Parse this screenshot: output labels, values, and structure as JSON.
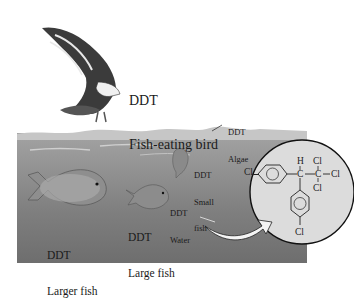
{
  "labels": {
    "bird": {
      "line1": "DDT",
      "line2": "Fish-eating bird"
    },
    "algae": {
      "line1": "DDT",
      "line2": "Algae"
    },
    "small_fish": {
      "line1": "DDT",
      "line2": "Small",
      "line3": "fish"
    },
    "water": {
      "line1": "DDT",
      "line2": "Water"
    },
    "large_fish": {
      "line1": "DDT",
      "line2": "Large fish"
    },
    "larger_fish": {
      "line1": "DDT",
      "line2": "Larger fish"
    }
  },
  "molecule": {
    "name": "DDT",
    "atoms": {
      "h": "H",
      "c1": "C",
      "c2": "C",
      "cl_top": "Cl",
      "cl_right": "Cl",
      "cl_bottom": "Cl",
      "cl_left": "Cl",
      "cl_para": "Cl"
    }
  },
  "colors": {
    "water_top": "#a3a3a3",
    "water_bottom": "#6e6e6e",
    "circle_fill": "#dcdcdc",
    "ink": "#1a1a1a"
  }
}
